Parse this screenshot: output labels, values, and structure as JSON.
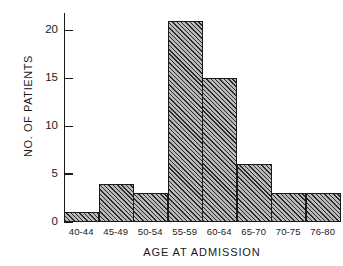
{
  "chart_data": {
    "type": "bar",
    "title": "",
    "subtitle": "",
    "xlabel": "AGE AT ADMISSION",
    "ylabel": "NO. OF PATIENTS",
    "categories": [
      "40-44",
      "45-49",
      "50-54",
      "55-59",
      "60-64",
      "65-70",
      "70-75",
      "76-80"
    ],
    "values": [
      1,
      4,
      3,
      21,
      15,
      6,
      3,
      3
    ],
    "ylim": [
      0,
      21.8
    ],
    "xlim": [
      0,
      8
    ],
    "yticks": [
      "0",
      "5",
      "10",
      "15",
      "20"
    ],
    "ytick_values": [
      0,
      5,
      10,
      15,
      20
    ],
    "grid": false,
    "legend": null,
    "legend_position": "none",
    "annotations": [],
    "series": [
      {
        "name": "No. of patients",
        "values": [
          1,
          4,
          3,
          21,
          15,
          6,
          3,
          3
        ]
      }
    ],
    "style": {
      "bar_fill": "#b9b9b9",
      "bar_hatch": "diagonal-45",
      "bar_edge": "#1b1b1b",
      "axis_color": "#1a1a1a",
      "background": "#ffffff"
    }
  }
}
